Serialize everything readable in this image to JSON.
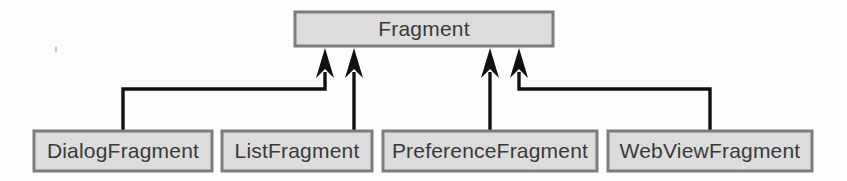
{
  "diagram": {
    "type": "uml-class-inheritance",
    "colors": {
      "box_fill": "#dcdcdc",
      "box_border": "#7d7d7d",
      "text": "#3a3a3a",
      "connector": "#111111",
      "background": "#fdfdfd"
    },
    "superclass": {
      "label": "Fragment",
      "x": 295,
      "y": 12,
      "width": 258,
      "height": 34,
      "center_x": 424
    },
    "subclasses": [
      {
        "label": "DialogFragment",
        "x": 34,
        "y": 131,
        "width": 178,
        "height": 40,
        "center_x": 123,
        "connector": "elbow-right",
        "arrow_x": 325
      },
      {
        "label": "ListFragment",
        "x": 222,
        "y": 131,
        "width": 150,
        "height": 40,
        "center_x": 297,
        "connector": "straight",
        "arrow_x": 354
      },
      {
        "label": "PreferenceFragment",
        "x": 383,
        "y": 131,
        "width": 214,
        "height": 40,
        "center_x": 490,
        "connector": "straight",
        "arrow_x": 490
      },
      {
        "label": "WebViewFragment",
        "x": 608,
        "y": 131,
        "width": 204,
        "height": 40,
        "center_x": 710,
        "connector": "elbow-left",
        "arrow_x": 519
      }
    ],
    "relationship": "generalization",
    "elbow_y": 89
  }
}
